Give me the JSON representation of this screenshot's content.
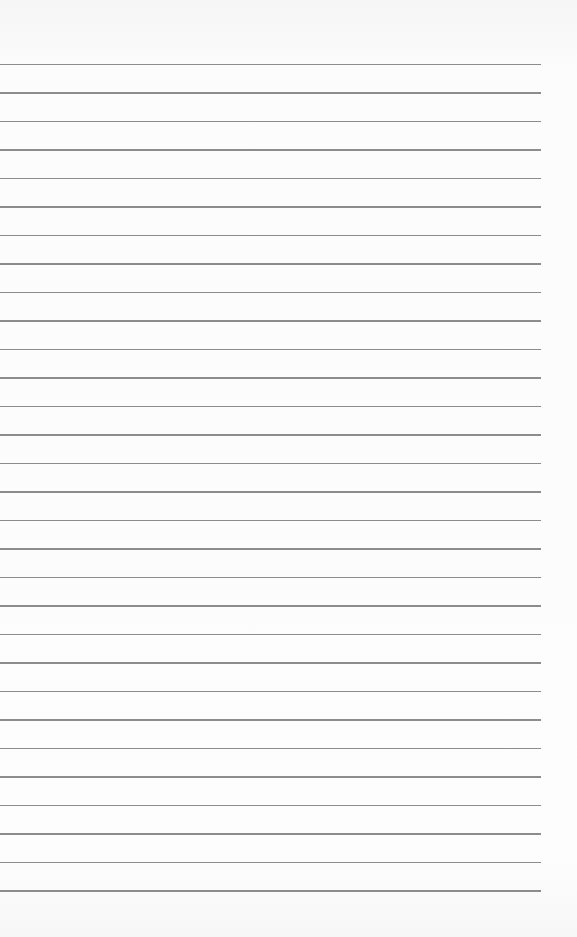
{
  "paper": {
    "type": "lined-notebook-paper",
    "line_count": 30,
    "line_color": "#8c8c8c",
    "background_color": "#fbfbfb"
  }
}
